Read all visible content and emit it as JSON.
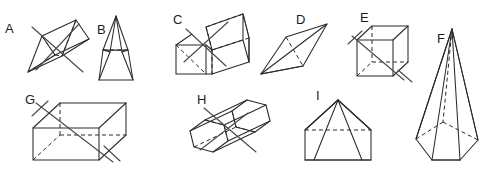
{
  "worksheet": {
    "title": "Geometric Solids Identification Worksheet",
    "background_color": "#ffffff",
    "edge_color": "#2b2b2b",
    "hidden_edge_color": "#2b2b2b",
    "cross_mark_color": "#4a4a4a",
    "label_color": "#1d1d1d",
    "width": 485,
    "height": 172
  },
  "shapes": [
    {
      "label": "A",
      "name": "tilted-triangular-prism",
      "description": "Triangular prism drawn tilted, with dashed hidden edges and a large X cross-out mark",
      "marked_out": true,
      "label_x": 5,
      "label_y": 33
    },
    {
      "label": "B",
      "name": "narrow-rectangular-pyramid",
      "description": "Tall narrow pyramid on a rectangular prism base with dashed hidden edge",
      "marked_out": false,
      "label_x": 97,
      "label_y": 34
    },
    {
      "label": "C",
      "name": "tilted-cube-prism",
      "description": "Oblique square prism (box) with dashed hidden edges and an X cross-out mark",
      "marked_out": true,
      "label_x": 173,
      "label_y": 24
    },
    {
      "label": "D",
      "name": "flat-tetrahedron",
      "description": "Flattened tetrahedron drawn as a rhombus with interior diagonals and a dashed hidden edge",
      "marked_out": false,
      "label_x": 296,
      "label_y": 24
    },
    {
      "label": "E",
      "name": "cube",
      "description": "Cube in standard isometric view with dashed hidden edges and an X cross-out mark",
      "marked_out": true,
      "label_x": 360,
      "label_y": 22
    },
    {
      "label": "F",
      "name": "tall-hexagonal-pyramid",
      "description": "Tall hexagonal pyramid with dashed hidden base edges",
      "marked_out": false,
      "label_x": 437,
      "label_y": 43
    },
    {
      "label": "G",
      "name": "rectangular-prism",
      "description": "Rectangular prism (cuboid) with dashed hidden edges and an X cross-out mark",
      "marked_out": true,
      "label_x": 25,
      "label_y": 104
    },
    {
      "label": "H",
      "name": "tilted-hexagonal-prism",
      "description": "Hexagonal prism drawn tilted diagonally with dashed hidden edges and an X cross-out mark",
      "marked_out": true,
      "label_x": 197,
      "label_y": 104
    },
    {
      "label": "I",
      "name": "square-pyramid",
      "description": "Square-based pyramid with dashed hidden base edge",
      "marked_out": false,
      "label_x": 316,
      "label_y": 100
    }
  ]
}
